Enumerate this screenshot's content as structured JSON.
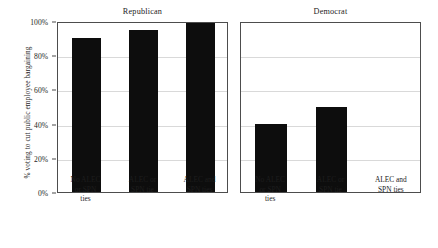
{
  "chart_data": {
    "type": "bar",
    "title": "",
    "xlabel": "",
    "ylabel": "% voting to cut public employee bargaining",
    "ylim": [
      0,
      100
    ],
    "yticks": [
      0,
      20,
      40,
      60,
      80,
      100
    ],
    "ytick_labels": [
      "0%",
      "20%",
      "40%",
      "60%",
      "80%",
      "100%"
    ],
    "grid": true,
    "legend": "none",
    "facet_by": "party",
    "categories": [
      "No ALEC or SPN ties",
      "ALEC or SPN tie",
      "ALEC and SPN ties"
    ],
    "category_lines": [
      [
        "No ALEC",
        "or SPN",
        "ties"
      ],
      [
        "ALEC or",
        "SPN tie"
      ],
      [
        "ALEC and",
        "SPN ties"
      ]
    ],
    "panels": [
      {
        "name": "Republican",
        "values": [
          90,
          95,
          100
        ]
      },
      {
        "name": "Democrat",
        "values": [
          40,
          50,
          0
        ]
      }
    ],
    "bar_color": "#0d0d0d",
    "grid_color": "#d9d9d9",
    "frame_color": "#4d4d4d",
    "background": "#ffffff"
  },
  "axis": {
    "y_title": "% voting to cut public employee bargaining",
    "ticks": [
      {
        "label": "100%",
        "value": 100
      },
      {
        "label": "80%",
        "value": 80
      },
      {
        "label": "60%",
        "value": 60
      },
      {
        "label": "40%",
        "value": 40
      },
      {
        "label": "20%",
        "value": 20
      },
      {
        "label": "0%",
        "value": 0
      }
    ]
  },
  "panels": {
    "republican": {
      "title": "Republican",
      "bars": [
        {
          "label_lines": [
            "No ALEC",
            "or SPN",
            "ties"
          ],
          "value": 90
        },
        {
          "label_lines": [
            "ALEC or",
            "SPN tie"
          ],
          "value": 95
        },
        {
          "label_lines": [
            "ALEC and",
            "SPN ties"
          ],
          "value": 100
        }
      ]
    },
    "democrat": {
      "title": "Democrat",
      "bars": [
        {
          "label_lines": [
            "No ALEC",
            "or SPN",
            "ties"
          ],
          "value": 40
        },
        {
          "label_lines": [
            "ALEC or",
            "SPN tie"
          ],
          "value": 50
        },
        {
          "label_lines": [
            "ALEC and",
            "SPN ties"
          ],
          "value": 0
        }
      ]
    }
  }
}
